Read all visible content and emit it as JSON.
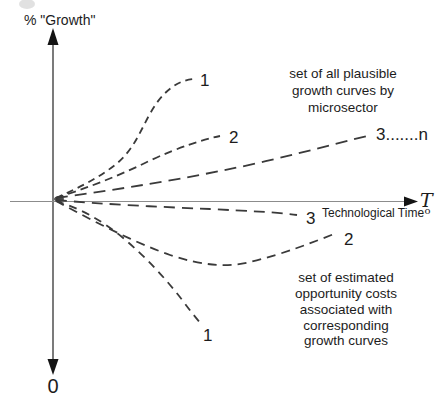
{
  "figure": {
    "y_axis": {
      "label": "% \"Growth\"",
      "bottom_end_label": "0"
    },
    "x_axis": {
      "label": "Technological Time",
      "terminal_symbol": "T",
      "terminal_symbol_subscript": "o"
    },
    "upper_region": {
      "annotation": [
        "set of all plausible",
        "growth curves by",
        "microsector"
      ],
      "curve_labels": [
        "1",
        "2",
        "3.......n"
      ]
    },
    "lower_region": {
      "annotation": [
        "set of estimated",
        "opportunity costs",
        "associated with",
        "corresponding",
        "growth curves"
      ],
      "curve_labels": [
        "3",
        "2",
        "1"
      ]
    },
    "colors": {
      "background": "#ffffff",
      "ink": "#1c1c1c",
      "curve": "#3a3a3a",
      "axis": "#5a5a5a"
    }
  }
}
